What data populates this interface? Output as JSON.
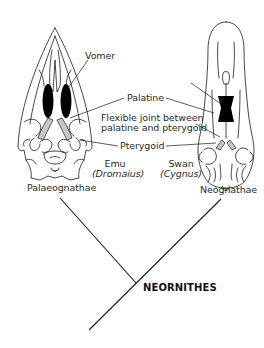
{
  "labels": {
    "vomer": "Vomer",
    "palatine": "Palatine",
    "flexible_joint_line1": "Flexible joint between",
    "flexible_joint_line2": "palatine and pterygoid",
    "pterygoid": "Pterygoid"
  },
  "species": {
    "emu": {
      "common": "Emu",
      "genus": "(Dromaius)",
      "group": "Palaeognathae"
    },
    "swan": {
      "common": "Swan",
      "genus": "(Cygnus)",
      "group": "Neognathae"
    }
  },
  "tree": {
    "clade": "NEORNITHES"
  },
  "colors": {
    "line": "#1a1a1a",
    "bone_fill": "#ffffff",
    "vomer_fill": "#000000",
    "joint_fill": "#c8c8c8"
  }
}
